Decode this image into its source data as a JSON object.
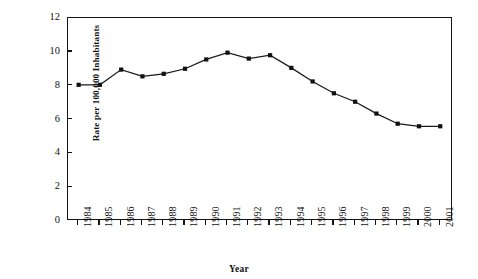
{
  "figure": {
    "partial_title": "",
    "background": "#ffffff",
    "line_color": "#1a1a1a",
    "marker_color": "#111111",
    "axis_color": "#141414"
  },
  "chart_data": {
    "type": "line",
    "title": "",
    "xlabel": "Year",
    "ylabel": "Rate per 100,000 Inhabitants",
    "xlim": [
      1983.5,
      2001.6
    ],
    "ylim": [
      0,
      12
    ],
    "yticks": [
      0,
      2,
      4,
      6,
      8,
      10,
      12
    ],
    "ytick_labels": [
      "0",
      "2",
      "4",
      "6",
      "8",
      "10",
      "12"
    ],
    "grid": false,
    "legend": false,
    "marker": "square",
    "categories": [
      "1984",
      "1985",
      "1986",
      "1987",
      "1988",
      "1989",
      "1990",
      "1991",
      "1992",
      "1993",
      "1994",
      "1995",
      "1996",
      "1997",
      "1998",
      "1999",
      "2000",
      "2001"
    ],
    "x": [
      1984,
      1985,
      1986,
      1987,
      1988,
      1989,
      1990,
      1991,
      1992,
      1993,
      1994,
      1995,
      1996,
      1997,
      1998,
      1999,
      2000,
      2001
    ],
    "values": [
      8.05,
      8.05,
      8.95,
      8.55,
      8.7,
      9.0,
      9.55,
      9.95,
      9.6,
      9.8,
      9.05,
      8.25,
      7.55,
      7.05,
      6.35,
      5.75,
      5.6,
      5.6
    ],
    "series": [
      {
        "name": "Rate per 100,000 Inhabitants",
        "values": [
          8.05,
          8.05,
          8.95,
          8.55,
          8.7,
          9.0,
          9.55,
          9.95,
          9.6,
          9.8,
          9.05,
          8.25,
          7.55,
          7.05,
          6.35,
          5.75,
          5.6,
          5.6
        ]
      }
    ],
    "annotations": []
  }
}
